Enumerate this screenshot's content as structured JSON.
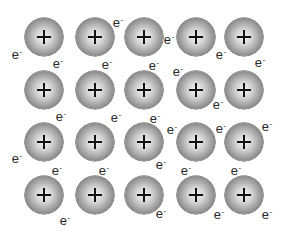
{
  "diagram": {
    "ion_symbol": "+",
    "electron_symbol": "e",
    "electron_charge": "-",
    "colors": {
      "background": "#ffffff",
      "ion_center": "#f4f4f4",
      "ion_edge": "#474747",
      "text": "#2a2a2a"
    },
    "ions": [
      {
        "x": 44,
        "y": 37
      },
      {
        "x": 95,
        "y": 37
      },
      {
        "x": 144,
        "y": 37
      },
      {
        "x": 196,
        "y": 37
      },
      {
        "x": 244,
        "y": 37
      },
      {
        "x": 44,
        "y": 90
      },
      {
        "x": 95,
        "y": 90
      },
      {
        "x": 144,
        "y": 90
      },
      {
        "x": 196,
        "y": 90
      },
      {
        "x": 244,
        "y": 90
      },
      {
        "x": 44,
        "y": 142
      },
      {
        "x": 95,
        "y": 142
      },
      {
        "x": 144,
        "y": 142
      },
      {
        "x": 196,
        "y": 142
      },
      {
        "x": 244,
        "y": 142
      },
      {
        "x": 44,
        "y": 195
      },
      {
        "x": 95,
        "y": 195
      },
      {
        "x": 144,
        "y": 195
      },
      {
        "x": 196,
        "y": 195
      },
      {
        "x": 244,
        "y": 195
      }
    ],
    "electrons": [
      {
        "x": 17,
        "y": 53
      },
      {
        "x": 118,
        "y": 21
      },
      {
        "x": 169,
        "y": 38
      },
      {
        "x": 221,
        "y": 53
      },
      {
        "x": 260,
        "y": 61
      },
      {
        "x": 58,
        "y": 62
      },
      {
        "x": 107,
        "y": 63
      },
      {
        "x": 154,
        "y": 64
      },
      {
        "x": 178,
        "y": 70
      },
      {
        "x": 218,
        "y": 103
      },
      {
        "x": 61,
        "y": 115
      },
      {
        "x": 116,
        "y": 116
      },
      {
        "x": 155,
        "y": 117
      },
      {
        "x": 172,
        "y": 128
      },
      {
        "x": 221,
        "y": 127
      },
      {
        "x": 267,
        "y": 125
      },
      {
        "x": 17,
        "y": 157
      },
      {
        "x": 57,
        "y": 169
      },
      {
        "x": 104,
        "y": 169
      },
      {
        "x": 161,
        "y": 163
      },
      {
        "x": 186,
        "y": 169
      },
      {
        "x": 236,
        "y": 169
      },
      {
        "x": 65,
        "y": 219
      },
      {
        "x": 161,
        "y": 212
      },
      {
        "x": 219,
        "y": 213
      },
      {
        "x": 267,
        "y": 213
      }
    ]
  }
}
